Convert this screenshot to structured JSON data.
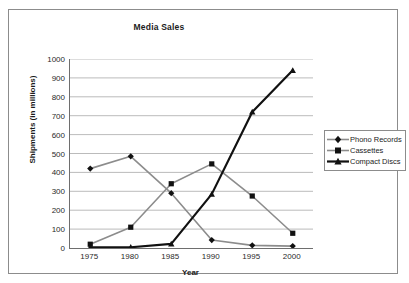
{
  "chart_data": {
    "type": "line",
    "title": "Media Sales",
    "xlabel": "Year",
    "ylabel": "Shipments (in millions)",
    "categories": [
      "1975",
      "1980",
      "1985",
      "1990",
      "1995",
      "2000"
    ],
    "x": [
      1975,
      1980,
      1985,
      1990,
      1995,
      2000
    ],
    "ylim": [
      0,
      1000
    ],
    "yticks": [
      "0",
      "100",
      "200",
      "300",
      "400",
      "500",
      "600",
      "700",
      "800",
      "900",
      "1000"
    ],
    "ytick_values": [
      0,
      100,
      200,
      300,
      400,
      500,
      600,
      700,
      800,
      900,
      1000
    ],
    "grid": "horizontal",
    "legend_position": "right",
    "series": [
      {
        "name": "Phono Records",
        "marker": "diamond",
        "color": "#8c8c8c",
        "marker_color": "#111111",
        "line_width": 1.6,
        "values": [
          420,
          485,
          290,
          42,
          14,
          10
        ]
      },
      {
        "name": "Cassettes",
        "marker": "square",
        "color": "#8c8c8c",
        "marker_color": "#111111",
        "line_width": 1.6,
        "values": [
          20,
          110,
          340,
          445,
          275,
          78
        ]
      },
      {
        "name": "Compact Discs",
        "marker": "triangle",
        "color": "#111111",
        "marker_color": "#111111",
        "line_width": 2.2,
        "values": [
          3,
          4,
          22,
          285,
          720,
          940
        ]
      }
    ]
  },
  "legend": {
    "items": [
      {
        "label": "Phono Records"
      },
      {
        "label": "Cassettes"
      },
      {
        "label": "Compact Discs"
      }
    ]
  },
  "colors": {
    "gridline": "#a9a9a9",
    "axis": "#6e6e6e",
    "frame": "#8c8c8c",
    "text": "#1b1b1b",
    "background": "#ffffff"
  }
}
